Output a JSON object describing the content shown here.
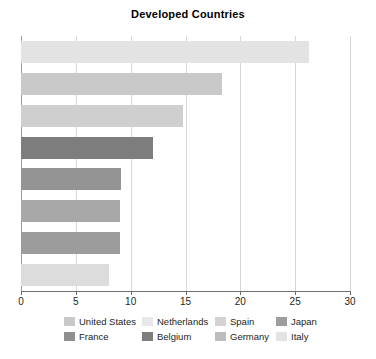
{
  "chart_data": {
    "type": "bar",
    "orientation": "horizontal",
    "title": "Developed Countries",
    "xlabel": "",
    "ylabel": "",
    "xlim": [
      0,
      30
    ],
    "xticks": [
      0,
      5,
      10,
      15,
      20,
      25,
      30
    ],
    "xtick_labels": [
      "0",
      "5",
      "10",
      "15",
      "20",
      "25",
      "30"
    ],
    "grid": true,
    "grid_axis": "x",
    "legend_position": "bottom",
    "legend_columns": 4,
    "categories": [
      "United States",
      "Netherlands",
      "Spain",
      "Japan",
      "France",
      "Belgium",
      "Germany",
      "Italy"
    ],
    "values": [
      26.3,
      18.3,
      14.8,
      12.0,
      9.1,
      9.0,
      9.0,
      8.0
    ],
    "colors": [
      "#e3e3e3",
      "#c9c9c9",
      "#cfcfcf",
      "#7d7d7d",
      "#949494",
      "#a8a8a8",
      "#9c9c9c",
      "#dcdcdc"
    ],
    "bars": [
      {
        "label": "United States",
        "value": 26.3,
        "color": "#e3e3e3"
      },
      {
        "label": "Netherlands",
        "value": 18.3,
        "color": "#c9c9c9"
      },
      {
        "label": "Spain",
        "value": 14.8,
        "color": "#cfcfcf"
      },
      {
        "label": "Japan",
        "value": 12.0,
        "color": "#7d7d7d"
      },
      {
        "label": "France",
        "value": 9.1,
        "color": "#949494"
      },
      {
        "label": "Belgium",
        "value": 9.0,
        "color": "#a8a8a8"
      },
      {
        "label": "Germany",
        "value": 9.0,
        "color": "#9c9c9c"
      },
      {
        "label": "Italy",
        "value": 8.0,
        "color": "#dcdcdc"
      }
    ],
    "legend": [
      {
        "label": "United States",
        "color": "#c9c9c9"
      },
      {
        "label": "Netherlands",
        "color": "#e8e8e8"
      },
      {
        "label": "Spain",
        "color": "#d3d3d3"
      },
      {
        "label": "Japan",
        "color": "#9c9c9c"
      },
      {
        "label": "France",
        "color": "#8f8f8f"
      },
      {
        "label": "Belgium",
        "color": "#7d7d7d"
      },
      {
        "label": "Germany",
        "color": "#bdbdbd"
      },
      {
        "label": "Italy",
        "color": "#e3e3e3"
      }
    ]
  },
  "style": {
    "axis_color": "#6f6f6f",
    "grid_color": "#d8d8d8",
    "text_color": "#231f20",
    "background": "#ffffff"
  }
}
